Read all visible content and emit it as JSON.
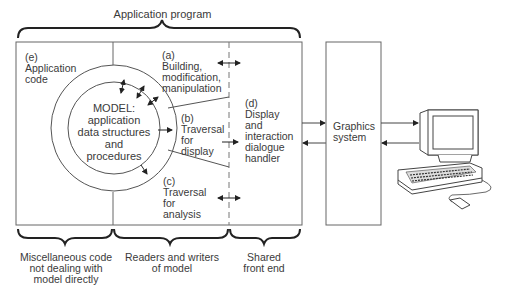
{
  "title": "Application program",
  "regions": {
    "e": {
      "tag": "(e)",
      "lines": [
        "Application",
        "code"
      ]
    },
    "a": {
      "tag": "(a)",
      "lines": [
        "Building,",
        "modification,",
        "manipulation"
      ]
    },
    "b": {
      "tag": "(b)",
      "lines": [
        "Traversal",
        "for",
        "display"
      ]
    },
    "c": {
      "tag": "(c)",
      "lines": [
        "Traversal",
        "for",
        "analysis"
      ]
    },
    "d": {
      "tag": "(d)",
      "lines": [
        "Display",
        "and",
        "interaction",
        "dialogue",
        "handler"
      ]
    }
  },
  "model": {
    "lines": [
      "MODEL:",
      "application",
      "data structures",
      "and",
      "procedures"
    ]
  },
  "graphics": {
    "lines": [
      "Graphics",
      "system"
    ]
  },
  "bottom_labels": [
    {
      "lines": [
        "Miscellaneous code",
        "not dealing with",
        "model directly"
      ]
    },
    {
      "lines": [
        "Readers and writers",
        "of model"
      ]
    },
    {
      "lines": [
        "Shared",
        "front end"
      ]
    }
  ],
  "devices": [
    "monitor",
    "keyboard",
    "mouse"
  ]
}
